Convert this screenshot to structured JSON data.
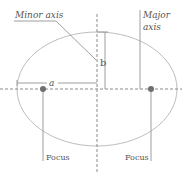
{
  "diagram": {
    "type": "ellipse-anatomy",
    "labels": {
      "minor_axis": "Minor axis",
      "major_axis_line1": "Major",
      "major_axis_line2": "axis",
      "semi_major": "a",
      "semi_minor": "b",
      "focus_left": "Focus",
      "focus_right": "Focus"
    },
    "colors": {
      "ellipse": "#bdbdbd",
      "axis_dashed": "#8a8a8a",
      "leader_lines": "#9e9e9e",
      "focus_point": "#6e6e6e",
      "text": "#555555"
    }
  }
}
